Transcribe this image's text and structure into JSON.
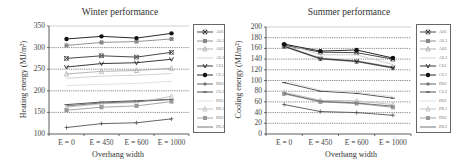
{
  "chart_data": [
    {
      "type": "line",
      "title": "Winter performance",
      "xlabel": "Overhang width",
      "ylabel": "Heating energy (MJ/m²)",
      "categories": [
        "E = 0",
        "E = 450",
        "E = 600",
        "E = 1000"
      ],
      "ylim": [
        100,
        350
      ],
      "yticks": [
        100,
        150,
        200,
        250,
        300,
        350
      ],
      "grid": "dashed horizontal at 150, 200, 250, 300",
      "legend_position": "right",
      "series": [
        {
          "name": "A01",
          "values": [
            275,
            281,
            278,
            289
          ],
          "color": "#333333",
          "marker": "x"
        },
        {
          "name": "AL1",
          "values": [
            305,
            312,
            314,
            320
          ],
          "color": "#888888",
          "marker": "square"
        },
        {
          "name": "A02",
          "values": [
            239,
            245,
            247,
            252
          ],
          "color": "#aaaaaa",
          "marker": "triangle"
        },
        {
          "name": "AL2",
          "values": [
            229,
            234,
            236,
            240
          ],
          "color": "#cccccc",
          "marker": "none"
        },
        {
          "name": "C01",
          "values": [
            255,
            263,
            265,
            273
          ],
          "color": "#222222",
          "marker": "v"
        },
        {
          "name": "CL1",
          "values": [
            320,
            326,
            322,
            333
          ],
          "color": "#111111",
          "marker": "circle"
        },
        {
          "name": "D02",
          "values": [
            115,
            124,
            126,
            135
          ],
          "color": "#555555",
          "marker": "plus"
        },
        {
          "name": "CL2",
          "values": [
            168,
            174,
            177,
            180
          ],
          "color": "#444444",
          "marker": "dash"
        },
        {
          "name": "D01",
          "values": [
            212,
            215,
            217,
            222
          ],
          "color": "#dddddd",
          "marker": "none"
        },
        {
          "name": "DL1",
          "values": [
            162,
            170,
            173,
            187
          ],
          "color": "#bbbbbb",
          "marker": "triangle"
        },
        {
          "name": "D02",
          "values": [
            155,
            162,
            165,
            175
          ],
          "color": "#999999",
          "marker": "square"
        },
        {
          "name": "DL2",
          "values": [
            165,
            172,
            175,
            180
          ],
          "color": "#666666",
          "marker": "none"
        }
      ]
    },
    {
      "type": "line",
      "title": "Summer performance",
      "xlabel": "Overhang width",
      "ylabel": "Cooling energy (MJ/m²)",
      "categories": [
        "E = 0",
        "E = 450",
        "E = 600",
        "E = 1000"
      ],
      "ylim": [
        0,
        200
      ],
      "yticks": [
        0,
        20,
        40,
        60,
        80,
        100,
        120,
        140,
        160,
        180,
        200
      ],
      "grid": "dashed horizontal at every 20",
      "legend_position": "right",
      "series": [
        {
          "name": "A01",
          "values": [
            166,
            153,
            152,
            140
          ],
          "color": "#333333",
          "marker": "x"
        },
        {
          "name": "AL1",
          "values": [
            163,
            140,
            135,
            123
          ],
          "color": "#888888",
          "marker": "square"
        },
        {
          "name": "A02",
          "values": [
            165,
            142,
            137,
            125
          ],
          "color": "#aaaaaa",
          "marker": "triangle"
        },
        {
          "name": "AL2",
          "values": [
            170,
            148,
            148,
            130
          ],
          "color": "#cccccc",
          "marker": "none"
        },
        {
          "name": "C01",
          "values": [
            164,
            141,
            136,
            124
          ],
          "color": "#222222",
          "marker": "v"
        },
        {
          "name": "CL1",
          "values": [
            168,
            155,
            157,
            142
          ],
          "color": "#111111",
          "marker": "circle"
        },
        {
          "name": "D02",
          "values": [
            55,
            42,
            40,
            35
          ],
          "color": "#555555",
          "marker": "plus"
        },
        {
          "name": "CL2",
          "values": [
            96,
            80,
            76,
            67
          ],
          "color": "#444444",
          "marker": "dash"
        },
        {
          "name": "D01",
          "values": [
            100,
            82,
            78,
            70
          ],
          "color": "#dddddd",
          "marker": "none"
        },
        {
          "name": "DL1",
          "values": [
            78,
            63,
            62,
            55
          ],
          "color": "#bbbbbb",
          "marker": "triangle"
        },
        {
          "name": "D02",
          "values": [
            75,
            60,
            57,
            50
          ],
          "color": "#999999",
          "marker": "square"
        },
        {
          "name": "DL2",
          "values": [
            76,
            61,
            58,
            52
          ],
          "color": "#666666",
          "marker": "none"
        }
      ]
    }
  ],
  "legend_labels": [
    "A01",
    "AL1",
    "A02",
    "AL2",
    "C01",
    "CL1",
    "D02",
    "CL2",
    "D01",
    "DL1",
    "D02",
    "DL2"
  ],
  "winter": {
    "title": "Winter performance",
    "xlabel": "Overhang width",
    "ylabel": "Heating  energy (MJ/m²)",
    "yticks": [
      "350",
      "300",
      "250",
      "200",
      "150",
      "100"
    ],
    "xticks": [
      "E = 0",
      "E = 450",
      "E = 600",
      "E = 1000"
    ]
  },
  "summer": {
    "title": "Summer performance",
    "xlabel": "Overhang width",
    "ylabel": "Cooling  energy (MJ/m²)",
    "yticks": [
      "200",
      "180",
      "160",
      "140",
      "120",
      "100",
      "80",
      "60",
      "40",
      "20",
      "0"
    ],
    "xticks": [
      "E = 0",
      "E = 450",
      "E = 600",
      "E = 1000"
    ]
  }
}
